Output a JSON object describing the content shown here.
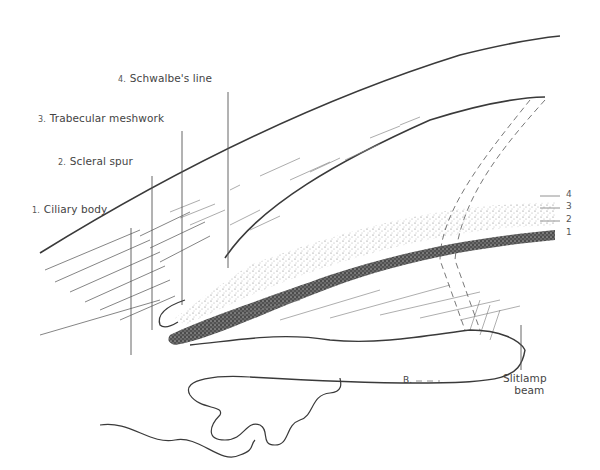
{
  "figure": {
    "type": "anatomical line drawing"
  },
  "labels": [
    {
      "num": "1.",
      "text": "Ciliary body"
    },
    {
      "num": "2.",
      "text": "Scleral spur"
    },
    {
      "num": "3.",
      "text": "Trabecular meshwork"
    },
    {
      "num": "4.",
      "text": "Schwalbe's line"
    }
  ],
  "side_markers": [
    "4",
    "3",
    "2",
    "1"
  ],
  "slitlamp_label": {
    "line1": "Slitlamp",
    "line2": "beam"
  },
  "iris_marker": "B.",
  "colors": {
    "ink": "#3a3a3a",
    "label": "#444444",
    "background": "#ffffff"
  }
}
